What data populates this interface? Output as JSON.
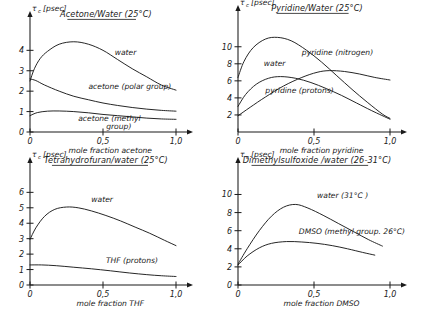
{
  "figure": {
    "panel_count": 4,
    "style": "hand-drawn line plots",
    "y_unit_label": "[psec]",
    "y_symbol": "τ",
    "y_symbol_sub": "c"
  },
  "chart_data": [
    {
      "id": "acetone-water",
      "type": "line",
      "title": "Acetone/Water (25°C)",
      "xlabel": "mole fraction acetone",
      "ylabel": "τc [psec]",
      "xlim": [
        0,
        1.0
      ],
      "ylim": [
        0,
        4.8
      ],
      "xticks": [
        0,
        0.5,
        1.0
      ],
      "xticklabels": [
        "0",
        "0,5",
        "1,0"
      ],
      "yticks": [
        0,
        1,
        2,
        3,
        4
      ],
      "yticklabels": [
        "0",
        "1",
        "2",
        "3",
        "4"
      ],
      "grid": false,
      "legend": "inline-annotations",
      "series": [
        {
          "name": "water",
          "label": "water",
          "label_x": 0.58,
          "label_y": 3.75,
          "x": [
            0.0,
            0.03,
            0.07,
            0.12,
            0.2,
            0.3,
            0.4,
            0.5,
            0.6,
            0.7,
            0.8,
            0.9,
            1.0
          ],
          "y": [
            2.5,
            3.1,
            3.6,
            3.95,
            4.3,
            4.42,
            4.3,
            4.0,
            3.55,
            3.1,
            2.7,
            2.3,
            2.05
          ]
        },
        {
          "name": "acetone-polar-group",
          "label": "acetone (polar group)",
          "label_x": 0.4,
          "label_y": 2.1,
          "x": [
            0.0,
            0.04,
            0.1,
            0.2,
            0.3,
            0.4,
            0.5,
            0.6,
            0.7,
            0.8,
            0.9,
            1.0
          ],
          "y": [
            2.6,
            2.52,
            2.3,
            2.0,
            1.75,
            1.58,
            1.42,
            1.3,
            1.2,
            1.12,
            1.06,
            1.02
          ]
        },
        {
          "name": "acetone-methyl-group",
          "label": "acetone (methyl group)",
          "label_x": 0.33,
          "label_y": 0.52,
          "x": [
            0.0,
            0.05,
            0.12,
            0.2,
            0.3,
            0.4,
            0.5,
            0.6,
            0.7,
            0.8,
            0.9,
            1.0
          ],
          "y": [
            0.8,
            0.95,
            1.02,
            1.03,
            1.0,
            0.94,
            0.86,
            0.8,
            0.74,
            0.68,
            0.64,
            0.62
          ]
        }
      ]
    },
    {
      "id": "pyridine-water",
      "type": "line",
      "title": "Pyridine/Water (25°C)",
      "xlabel": "mole fraction pyridine",
      "ylabel": "τc [psec]",
      "xlim": [
        0,
        1.0
      ],
      "ylim": [
        0,
        12.2
      ],
      "xticks": [
        0,
        0.5,
        1.0
      ],
      "xticklabels": [
        "0",
        "0,5",
        "1,0"
      ],
      "yticks": [
        2,
        4,
        6,
        8,
        10
      ],
      "yticklabels": [
        "2",
        "4",
        "6",
        "8",
        "10"
      ],
      "grid": false,
      "legend": "inline-annotations",
      "series": [
        {
          "name": "water",
          "label": "water",
          "label_x": 0.17,
          "label_y": 7.8,
          "x": [
            0.0,
            0.04,
            0.1,
            0.18,
            0.26,
            0.35,
            0.45,
            0.55,
            0.65,
            0.75,
            0.85,
            0.95,
            1.0
          ],
          "y": [
            6.4,
            8.3,
            9.9,
            10.9,
            11.1,
            10.7,
            9.6,
            8.2,
            6.6,
            5.0,
            3.5,
            2.1,
            1.6
          ]
        },
        {
          "name": "pyridine-nitrogen",
          "label": "pyridine (nitrogen)",
          "label_x": 0.42,
          "label_y": 9.0,
          "x": [
            0.0,
            0.08,
            0.18,
            0.3,
            0.42,
            0.52,
            0.6,
            0.7,
            0.8,
            0.9,
            1.0
          ],
          "y": [
            1.9,
            2.9,
            4.1,
            5.4,
            6.4,
            7.0,
            7.2,
            7.1,
            6.8,
            6.4,
            6.1
          ]
        },
        {
          "name": "pyridine-protons",
          "label": "pyridine (protons)",
          "label_x": 0.18,
          "label_y": 4.6,
          "x": [
            0.0,
            0.05,
            0.12,
            0.2,
            0.28,
            0.38,
            0.48,
            0.58,
            0.68,
            0.78,
            0.88,
            1.0
          ],
          "y": [
            3.0,
            4.4,
            5.6,
            6.3,
            6.5,
            6.3,
            5.8,
            5.1,
            4.3,
            3.4,
            2.5,
            1.5
          ]
        }
      ]
    },
    {
      "id": "thf-water",
      "type": "line",
      "title": "Tetrahydrofuran/water (25°C)",
      "xlabel": "mole fraction THF",
      "ylabel": "τc [psec]",
      "xlim": [
        0,
        1.0
      ],
      "ylim": [
        0,
        6.8
      ],
      "xticks": [
        0,
        0.5,
        1.0
      ],
      "xticklabels": [
        "0",
        "0,5",
        "1,0"
      ],
      "yticks": [
        0,
        1,
        2,
        3,
        4,
        5,
        6
      ],
      "yticklabels": [
        "0",
        "1",
        "2",
        "3",
        "4",
        "5",
        "6"
      ],
      "grid": false,
      "legend": "inline-annotations",
      "series": [
        {
          "name": "water",
          "label": "water",
          "label_x": 0.42,
          "label_y": 5.35,
          "x": [
            0.0,
            0.04,
            0.1,
            0.17,
            0.25,
            0.33,
            0.42,
            0.52,
            0.62,
            0.72,
            0.82,
            0.92,
            1.0
          ],
          "y": [
            2.95,
            3.7,
            4.45,
            4.9,
            5.05,
            5.0,
            4.8,
            4.5,
            4.15,
            3.75,
            3.35,
            2.9,
            2.55
          ]
        },
        {
          "name": "thf-protons",
          "label": "THF (protons)",
          "label_x": 0.52,
          "label_y": 1.45,
          "x": [
            0.0,
            0.08,
            0.18,
            0.3,
            0.42,
            0.55,
            0.68,
            0.8,
            0.9,
            1.0
          ],
          "y": [
            1.3,
            1.3,
            1.25,
            1.15,
            1.05,
            0.92,
            0.78,
            0.67,
            0.6,
            0.55
          ]
        }
      ]
    },
    {
      "id": "dmso-water",
      "type": "line",
      "title": "Dimethylsulfoxide /water (26-31°C)",
      "xlabel": "mole fraction DMSO",
      "ylabel": "τc [psec]",
      "xlim": [
        0,
        1.0
      ],
      "ylim": [
        0,
        11.6
      ],
      "xticks": [
        0,
        0.5,
        1.0
      ],
      "xticklabels": [
        "0",
        "0,5",
        "1,0"
      ],
      "yticks": [
        0,
        2,
        4,
        6,
        8,
        10
      ],
      "yticklabels": [
        "0",
        "2",
        "4",
        "6",
        "8",
        "10"
      ],
      "grid": false,
      "legend": "inline-annotations",
      "series": [
        {
          "name": "water-31C",
          "label": "water (31°C )",
          "label_x": 0.52,
          "label_y": 9.6,
          "x": [
            0.0,
            0.06,
            0.14,
            0.22,
            0.3,
            0.38,
            0.46,
            0.56,
            0.66,
            0.76,
            0.86,
            0.95
          ],
          "y": [
            2.3,
            4.0,
            6.0,
            7.6,
            8.6,
            8.9,
            8.5,
            7.7,
            6.8,
            5.9,
            5.0,
            4.3
          ]
        },
        {
          "name": "dmso-methyl-group-26C",
          "label": "DMSO (methyl group. 26°C)",
          "label_x": 0.4,
          "label_y": 5.6,
          "x": [
            0.0,
            0.06,
            0.14,
            0.22,
            0.32,
            0.42,
            0.52,
            0.62,
            0.72,
            0.82,
            0.9
          ],
          "y": [
            2.2,
            3.2,
            4.1,
            4.6,
            4.8,
            4.75,
            4.6,
            4.35,
            4.0,
            3.6,
            3.3
          ]
        }
      ]
    }
  ]
}
